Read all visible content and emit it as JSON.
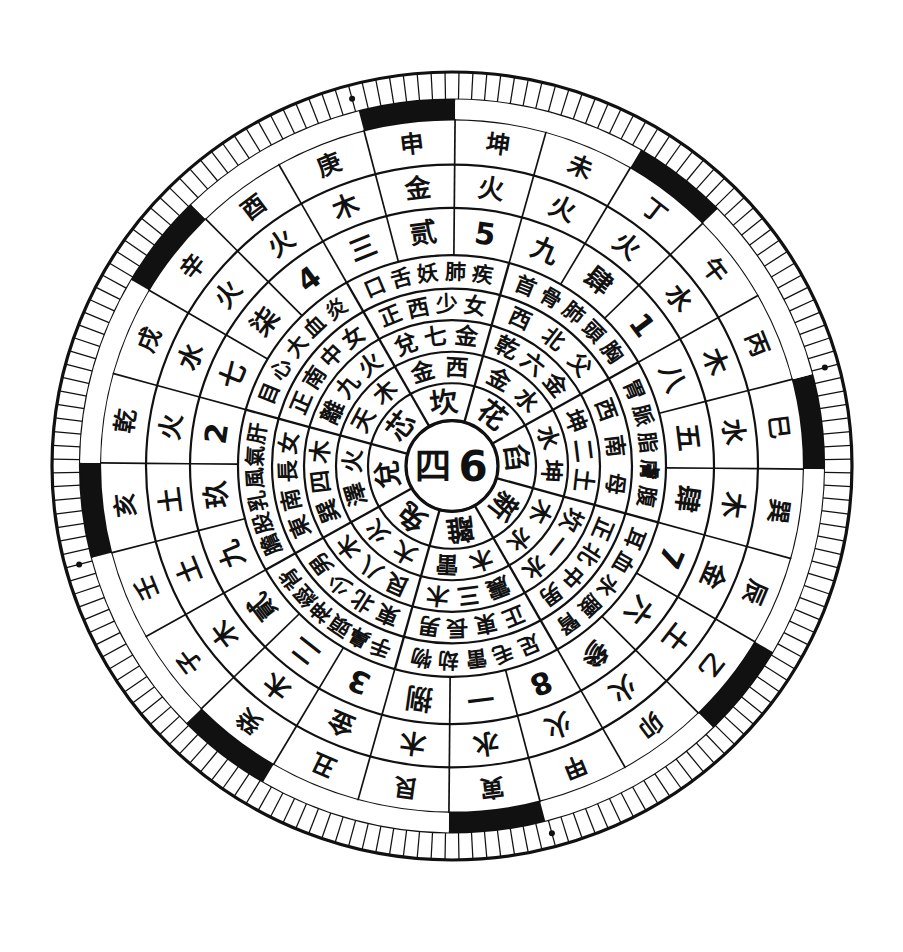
{
  "figure": {
    "center": {
      "chinese_numeral": "四",
      "arabic": "6"
    },
    "colors": {
      "ink": "#111111",
      "paper": "#ffffff"
    },
    "geometry": {
      "cx": 452,
      "cy": 466,
      "outer_radius": 400,
      "rotation_deg": -7
    }
  },
  "rings": [
    {
      "id": "ring-center",
      "name": "center-disc",
      "sectors": 1,
      "cells": [
        "四 6"
      ]
    },
    {
      "id": "ring-trigram-name",
      "name": "eight-trigram-names",
      "sectors": 8,
      "cells": [
        "臽",
        "新",
        "離",
        "兔",
        "兌",
        "芯",
        "坎",
        "花"
      ]
    },
    {
      "id": "ring-element-image",
      "name": "trigram-image-and-element",
      "sectors": 8,
      "cells": [
        "水 坤",
        "木 水",
        "木 雷",
        "大 火",
        "澤 火",
        "天 木",
        "金 西",
        "金 水"
      ]
    },
    {
      "id": "ring-trigram-number",
      "name": "trigram-number-element",
      "sectors": 8,
      "cells": [
        "坤二土",
        "坎一水",
        "震三木",
        "艮八木",
        "巽四木",
        "離九火",
        "兌七金",
        "乾六金"
      ]
    },
    {
      "id": "ring-direction-family",
      "name": "direction-and-family-member",
      "sectors": 8,
      "cells": [
        "西南母",
        "正北中男",
        "正東長男",
        "東北少男",
        "東南長女",
        "正南中女",
        "正西少女",
        "西北父"
      ]
    },
    {
      "id": "ring-body-parts",
      "name": "body-parts-and-attributes",
      "sectors": 8,
      "cells": [
        "胃脈脂膚腹",
        "耳血水腰腎",
        "足毛雷劫物",
        "手鼻頭神經背",
        "膽股乳風氣肝",
        "目心大血炎",
        "口舌妖肺疾",
        "首骨肺頭胸"
      ]
    },
    {
      "id": "ring-numbers",
      "name": "nine-star-numbers",
      "sectors": 24,
      "cells": [
        "五",
        "肆",
        "7",
        "六",
        "參",
        "8",
        "一",
        "捌",
        "3",
        "二",
        "貳",
        "九",
        "玖",
        "2",
        "七",
        "柒",
        "4",
        "三",
        "贰",
        "5",
        "九",
        "肆",
        "1",
        "八"
      ]
    },
    {
      "id": "ring-five-elements",
      "name": "five-element-ring",
      "sectors": 24,
      "cells": [
        "水",
        "木",
        "金",
        "土",
        "火",
        "火",
        "水",
        "木",
        "金",
        "木",
        "木",
        "土",
        "土",
        "火",
        "水",
        "火",
        "火",
        "木",
        "金",
        "火",
        "火",
        "火",
        "水",
        "木"
      ]
    },
    {
      "id": "ring-24-mountains",
      "name": "twenty-four-mountains",
      "sectors": 24,
      "cells": [
        "巳",
        "巽",
        "辰",
        "乙",
        "卯",
        "甲",
        "寅",
        "艮",
        "丑",
        "癸",
        "子",
        "壬",
        "亥",
        "乾",
        "戌",
        "辛",
        "酉",
        "庚",
        "申",
        "坤",
        "未",
        "丁",
        "午",
        "丙"
      ]
    },
    {
      "id": "ring-trigram-bars",
      "name": "trigram-bar-symbols",
      "sectors": 8,
      "cells": [
        "☷",
        "☳",
        "☲",
        "☶",
        "☴",
        "☰",
        "☱",
        "☵"
      ]
    },
    {
      "id": "ring-black-white",
      "name": "alternating-black-white-band",
      "sectors": 24
    },
    {
      "id": "ring-degree-ticks",
      "name": "degree-tick-scale",
      "ticks": 180
    }
  ],
  "labels": {
    "south": "南",
    "north": "北",
    "east": "東",
    "west": "西"
  }
}
